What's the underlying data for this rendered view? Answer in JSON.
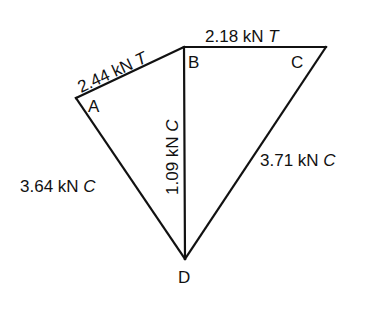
{
  "diagram": {
    "type": "truss-force-diagram",
    "nodes": [
      {
        "id": "A",
        "label": "A"
      },
      {
        "id": "B",
        "label": "B"
      },
      {
        "id": "C",
        "label": "C"
      },
      {
        "id": "D",
        "label": "D"
      }
    ],
    "members": [
      {
        "from": "A",
        "to": "B",
        "force": "2.44 kN",
        "type": "T"
      },
      {
        "from": "B",
        "to": "C",
        "force": "2.18 kN",
        "type": "T"
      },
      {
        "from": "B",
        "to": "D",
        "force": "1.09 kN",
        "type": "C"
      },
      {
        "from": "A",
        "to": "D",
        "force": "3.64 kN",
        "type": "C"
      },
      {
        "from": "C",
        "to": "D",
        "force": "3.71 kN",
        "type": "C"
      }
    ]
  }
}
